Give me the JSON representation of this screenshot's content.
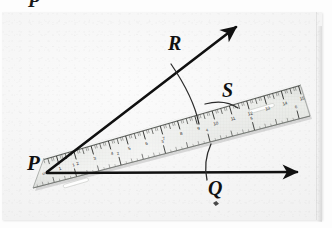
{
  "figure": {
    "type": "geometry-diagram-photo",
    "cropped_text_above": "P",
    "labels": [
      {
        "id": "P",
        "text": "P",
        "role": "vertex-endpoint-of-rays"
      },
      {
        "id": "R",
        "text": "R",
        "role": "point-on-upper-ray"
      },
      {
        "id": "S",
        "text": "S",
        "role": "point-on-ruler-edge"
      },
      {
        "id": "Q",
        "text": "Q",
        "role": "point-on-lower-ray"
      }
    ],
    "rays": [
      {
        "id": "ray-PR",
        "from": "P",
        "through": "R",
        "arrowhead": true
      },
      {
        "id": "ray-PQ",
        "from": "P",
        "through": "Q",
        "arrowhead": true
      }
    ],
    "arcs": [
      {
        "id": "arc-R",
        "marks": "R",
        "crosses": "ray-PR"
      },
      {
        "id": "arc-S",
        "marks": "S",
        "crosses": "ruler-edge"
      },
      {
        "id": "arc-Q",
        "marks": "Q",
        "crosses": "ray-PQ"
      }
    ],
    "ruler": {
      "name": "transparent-plastic-ruler",
      "zero_label": "cm",
      "top_scale_numbers": [
        "1",
        "2",
        "3",
        "4",
        "5",
        "6",
        "7",
        "8",
        "9",
        "10",
        "11",
        "12",
        "13",
        "14",
        "15"
      ],
      "bottom_scale_label": "inch",
      "bottom_scale_numbers": [
        "1",
        "2",
        "3",
        "4",
        "5",
        "6"
      ],
      "has_center_slot": true
    },
    "colors": {
      "ink": "#111111",
      "paper": "#fdfdfd",
      "panel": "#f3f3f3",
      "ruler_body": "#e9ebe8",
      "ruler_edge": "#6a6a6a",
      "tick": "#3a3a3a"
    }
  }
}
